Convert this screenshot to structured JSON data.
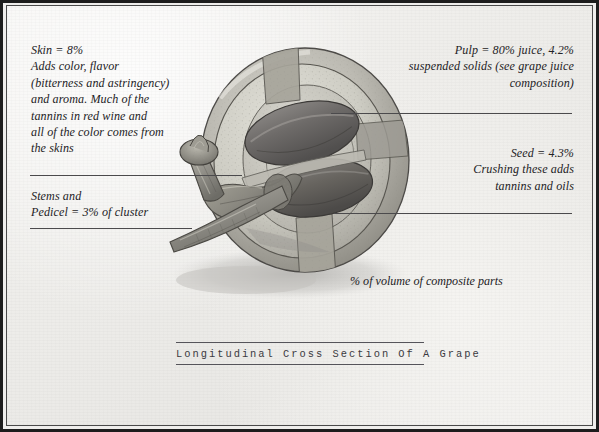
{
  "document": {
    "background_color": "#efeeec",
    "frame_color": "#1d1d1d",
    "ink_color": "#232225"
  },
  "annotations": {
    "skin": {
      "text": "Skin = 8%\nAdds color, flavor\n(bitterness and astringency)\nand aroma. Much of the\ntannins in red wine and\nall of the color comes from\nthe skins"
    },
    "stems": {
      "text": "Stems and\nPedicel = 3% of cluster"
    },
    "pulp": {
      "text": "Pulp = 80% juice, 4.2%\nsuspended solids (see grape juice\ncomposition)"
    },
    "seed": {
      "text": "Seed = 4.3%\nCrushing these adds\ntannins and oils"
    },
    "volume_note": {
      "text": "% of volume of composite parts"
    }
  },
  "caption": {
    "title": "Longitudinal Cross Section Of A Grape"
  },
  "illustration": {
    "subject": "grape-cross-section",
    "parts": [
      "skin",
      "pulp",
      "seed",
      "pedicel",
      "stem"
    ],
    "skin_color": "#8e8d86",
    "pulp_color": "#c9c8c0",
    "seed_color": "#6c6a68",
    "stem_color": "#8b8a80",
    "shadow_color": "#b9b8b5"
  }
}
